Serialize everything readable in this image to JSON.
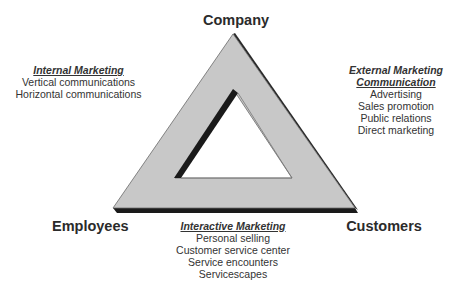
{
  "diagram": {
    "vertices": {
      "top": "Company",
      "bottom_left": "Employees",
      "bottom_right": "Customers"
    },
    "internal_marketing": {
      "title": "Internal Marketing",
      "items": [
        "Vertical communications",
        "Horizontal communications"
      ]
    },
    "external_marketing": {
      "title_line1": "External Marketing",
      "title_line2": "Communication",
      "items": [
        "Advertising",
        "Sales promotion",
        "Public relations",
        "Direct marketing"
      ]
    },
    "interactive_marketing": {
      "title": "Interactive Marketing",
      "items": [
        "Personal selling",
        "Customer service center",
        "Service encounters",
        "Servicescapes"
      ]
    },
    "colors": {
      "triangle_fill": "#c8c8c8",
      "shadow": "#1a1a1a",
      "outline": "#555555"
    }
  }
}
